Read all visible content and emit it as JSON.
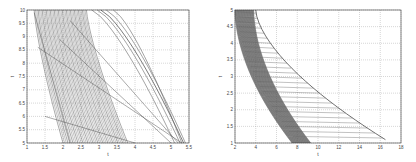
{
  "chart_data": [
    {
      "type": "line",
      "title": "",
      "xlabel": "t_i",
      "ylabel": "t_cp",
      "xlim": [
        1,
        5.5
      ],
      "ylim": [
        5,
        10
      ],
      "x_ticks": [
        "1",
        "1.5",
        "2",
        "2.5",
        "3",
        "3.5",
        "4",
        "4.5",
        "5",
        "5.5"
      ],
      "y_ticks": [
        "5",
        "5.5",
        "6",
        "6.5",
        "7",
        "7.5",
        "8",
        "8.5",
        "9",
        "9.5",
        "10"
      ],
      "grid": true,
      "description": "Dense family of decreasing curves (about 40) in the band x≈1.2–3.8, plus a few curves to the right reaching y=5 near x≈5.3, and straight connecting lines.",
      "series": [
        {
          "name": "band-left",
          "x": [
            1.2,
            1.5,
            1.8,
            2.0
          ],
          "y": [
            10,
            7.5,
            6.0,
            5.0
          ]
        },
        {
          "name": "band-right",
          "x": [
            2.6,
            2.9,
            3.2,
            3.8
          ],
          "y": [
            10,
            8.0,
            6.5,
            5.0
          ]
        },
        {
          "name": "outer-curve",
          "x": [
            2.8,
            3.5,
            4.5,
            5.3
          ],
          "y": [
            10,
            8.0,
            6.3,
            5.0
          ]
        },
        {
          "name": "line-a",
          "x": [
            1.3,
            5.3
          ],
          "y": [
            8.6,
            5.0
          ]
        },
        {
          "name": "line-b",
          "x": [
            1.5,
            4.0
          ],
          "y": [
            6.0,
            5.0
          ]
        }
      ]
    },
    {
      "type": "line",
      "title": "",
      "xlabel": "t_i",
      "ylabel": "t_cp",
      "xlim": [
        2,
        18
      ],
      "ylim": [
        1,
        5
      ],
      "x_ticks": [
        "2",
        "4",
        "6",
        "8",
        "10",
        "12",
        "14",
        "16",
        "18"
      ],
      "y_ticks": [
        "1",
        "1.5",
        "2",
        "2.5",
        "3",
        "3.5",
        "4",
        "4.5",
        "5"
      ],
      "grid": true,
      "description": "Dense shaded band of decreasing curves from x≈2–4 at y=5 down to x≈7–9 at y=1, an envelope curve from x≈4 at y=5 to x≈16.5 at y=1, and many straight lines fanning between them.",
      "series": [
        {
          "name": "band-left",
          "x": [
            2.0,
            2.5,
            3.5,
            5.0,
            8.0
          ],
          "y": [
            5,
            4.0,
            3.0,
            2.0,
            1.0
          ]
        },
        {
          "name": "band-right",
          "x": [
            3.8,
            4.3,
            5.3,
            6.5,
            9.0
          ],
          "y": [
            5,
            4.0,
            3.0,
            2.0,
            1.0
          ]
        },
        {
          "name": "envelope",
          "x": [
            4.0,
            6.5,
            9.5,
            12.5,
            16.5
          ],
          "y": [
            5,
            4.0,
            3.0,
            2.0,
            1.1
          ]
        }
      ]
    }
  ]
}
